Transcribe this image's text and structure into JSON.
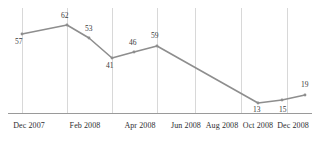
{
  "chart_data": {
    "type": "line",
    "title": "",
    "subtitle": "",
    "xlabel": "",
    "ylabel": "",
    "grid": "vertical",
    "legend": "none",
    "xlim": [
      0,
      8
    ],
    "ylim": [
      0,
      70
    ],
    "x": [
      "Dec 2007",
      "Jan 2008",
      "Mar 2008",
      "Apr 2008",
      "May 2008",
      "Jun 2008",
      "Nov 2008",
      "Dec 2008",
      "Jan 2009"
    ],
    "values": [
      57,
      62,
      53,
      41,
      46,
      59,
      13,
      15,
      19
    ],
    "point_labels": [
      "57",
      "62",
      "53",
      "41",
      "46",
      "59",
      "13",
      "15",
      "19"
    ],
    "points": [
      {
        "label": "57",
        "px": 22,
        "py": 34,
        "lx": 15,
        "ly": 38,
        "value": 57
      },
      {
        "label": "62",
        "px": 67,
        "py": 25,
        "lx": 61,
        "ly": 12,
        "value": 62
      },
      {
        "label": "53",
        "px": 89,
        "py": 38,
        "lx": 85,
        "ly": 25,
        "value": 53
      },
      {
        "label": "41",
        "px": 112,
        "py": 58,
        "lx": 106,
        "ly": 62,
        "value": 41
      },
      {
        "label": "46",
        "px": 134,
        "py": 52,
        "lx": 129,
        "ly": 39,
        "value": 46
      },
      {
        "label": "59",
        "px": 157,
        "py": 46,
        "lx": 151,
        "ly": 32,
        "value": 59
      },
      {
        "label": "13",
        "px": 258,
        "py": 103,
        "lx": 253,
        "ly": 106,
        "value": 13
      },
      {
        "label": "15",
        "px": 282,
        "py": 100,
        "lx": 279,
        "ly": 106,
        "value": 15
      },
      {
        "label": "19",
        "px": 305,
        "py": 95,
        "lx": 301,
        "ly": 81,
        "value": 19
      }
    ],
    "tick_labels": [
      "Dec 2007",
      "Feb 2008",
      "Apr 2008",
      "Jun 2008",
      "Aug 2008",
      "Oct 2008",
      "Dec 2008"
    ],
    "ticks": [
      {
        "label": "Dec 2007",
        "px": 29
      },
      {
        "label": "Feb 2008",
        "px": 85
      },
      {
        "label": "Apr 2008",
        "px": 140
      },
      {
        "label": "Jun 2008",
        "px": 186
      },
      {
        "label": "Aug 2008",
        "px": 222
      },
      {
        "label": "Oct 2008",
        "px": 258
      },
      {
        "label": "Dec 2008",
        "px": 293
      }
    ],
    "gridlines_x": [
      22,
      67,
      112,
      157,
      195,
      241,
      287
    ],
    "axis_baseline_y": 113,
    "colors": {
      "line": "#8e8e8e",
      "grid": "#d8d8d8",
      "axis": "#9a9a9a",
      "label_text": "#39393b",
      "tick_text": "#2e2e30",
      "background": "#ffffff"
    }
  }
}
